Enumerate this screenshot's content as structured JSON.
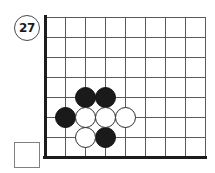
{
  "diagram": {
    "move_number_badge": {
      "label": "27",
      "cx": 27,
      "cy": 28,
      "r": 13,
      "border_color": "#4a4a4a",
      "text_color": "#1a1a1a",
      "font_size": 12
    },
    "board": {
      "origin_x": 45,
      "origin_y": 17,
      "cell": 20,
      "cols": 8,
      "rows": 7,
      "grid_color": "#5a5a5a",
      "axis_color": "#1c1c1c",
      "background": "#ffffff"
    },
    "stone_radius": 10.5,
    "stones": [
      {
        "color": "black",
        "col": 2,
        "row": 4,
        "label": "black-stone-c2r4"
      },
      {
        "color": "black",
        "col": 3,
        "row": 4,
        "label": "black-stone-c3r4"
      },
      {
        "color": "black",
        "col": 1,
        "row": 5,
        "label": "black-stone-c1r5"
      },
      {
        "color": "white",
        "col": 2,
        "row": 5,
        "label": "white-stone-c2r5"
      },
      {
        "color": "white",
        "col": 3,
        "row": 5,
        "label": "white-stone-c3r5"
      },
      {
        "color": "white",
        "col": 4,
        "row": 5,
        "label": "white-stone-c4r5"
      },
      {
        "color": "white",
        "col": 2,
        "row": 6,
        "label": "white-stone-c2r6"
      },
      {
        "color": "black",
        "col": 3,
        "row": 6,
        "label": "black-stone-c3r6"
      }
    ],
    "capture_box": {
      "x": 14,
      "y": 142,
      "width": 26,
      "height": 26,
      "border_color": "#808080",
      "fill": "#ffffff",
      "label": "empty-capture-box"
    }
  }
}
